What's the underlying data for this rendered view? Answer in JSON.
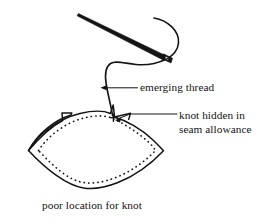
{
  "figure": {
    "title": "poor location for knot",
    "type": "sewing-diagram",
    "background_color": "#ffffff",
    "ink_color": "#141414",
    "labels": {
      "emerging_thread": "emerging thread",
      "knot_hidden_line1": "knot hidden in",
      "knot_hidden_line2": "seam allowance",
      "caption": "poor location for knot"
    },
    "elements": {
      "needle": "sewing-needle",
      "thread": "curved-thread",
      "fabric": "lens-shaped-fabric-piece",
      "stitch_line": "dotted-seam-stitching",
      "knot": "knot-mark",
      "leader_emerging_thread": "arrow-pointing-left-to-thread",
      "leader_knot": "arrow-pointing-left-to-knot"
    }
  }
}
